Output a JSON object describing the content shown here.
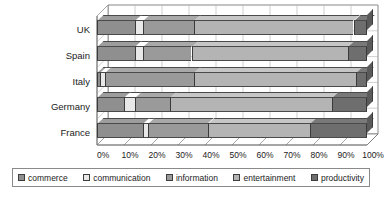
{
  "top_crop_text": "",
  "chart_data": {
    "type": "bar",
    "orientation": "horizontal",
    "stacked": true,
    "stack_mode": "percent",
    "title": "",
    "subtitle": "",
    "xlabel": "",
    "ylabel": "",
    "xlim": [
      0,
      100
    ],
    "xtick_labels": [
      "0%",
      "10%",
      "20%",
      "30%",
      "40%",
      "50%",
      "60%",
      "70%",
      "80%",
      "90%",
      "100%"
    ],
    "xtick_values": [
      0,
      10,
      20,
      30,
      40,
      50,
      60,
      70,
      80,
      90,
      100
    ],
    "grid": true,
    "grid_axis": "x",
    "legend_position": "bottom",
    "three_d": true,
    "categories": [
      "UK",
      "Spain",
      "Italy",
      "Germany",
      "France"
    ],
    "series": [
      {
        "name": "commerce",
        "color": "#8f8f8f",
        "values": [
          14,
          14,
          1,
          10,
          17
        ]
      },
      {
        "name": "communication",
        "color": "#e8e8e8",
        "values": [
          3,
          3,
          2,
          4,
          2
        ]
      },
      {
        "name": "information",
        "color": "#9a9a9a",
        "values": [
          19,
          18,
          33,
          13,
          22
        ]
      },
      {
        "name": "entertainment",
        "color": "#b4b4b4",
        "values": [
          59,
          58,
          60,
          60,
          38
        ]
      },
      {
        "name": "productivity",
        "color": "#6e6e6e",
        "values": [
          5,
          7,
          4,
          13,
          21
        ]
      }
    ]
  },
  "legend": {
    "items": [
      {
        "label": "commerce"
      },
      {
        "label": "communication"
      },
      {
        "label": "information"
      },
      {
        "label": "entertainment"
      },
      {
        "label": "productivity"
      }
    ]
  },
  "colors": {
    "commerce": "#8f8f8f",
    "communication": "#e8e8e8",
    "information": "#9a9a9a",
    "entertainment": "#b4b4b4",
    "productivity": "#6e6e6e",
    "gridline": "#b0b0b0",
    "axis": "#6d6d6d",
    "text": "#1b1b1b",
    "background": "#ffffff"
  }
}
